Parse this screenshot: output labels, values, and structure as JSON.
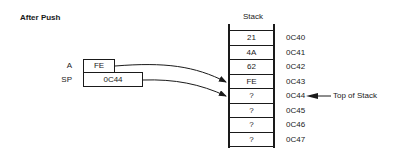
{
  "title": "After Push",
  "stack": {
    "title": "Stack",
    "rows": [
      {
        "value": "21",
        "address": "0C40"
      },
      {
        "value": "4A",
        "address": "0C41"
      },
      {
        "value": "62",
        "address": "0C42"
      },
      {
        "value": "FE",
        "address": "0C43"
      },
      {
        "value": "?",
        "address": "0C44"
      },
      {
        "value": "?",
        "address": "0C45"
      },
      {
        "value": "?",
        "address": "0C46"
      },
      {
        "value": "?",
        "address": "0C47"
      }
    ],
    "top_of_stack_label": "Top of Stack"
  },
  "registers": {
    "a": {
      "label": "A",
      "value": "FE"
    },
    "sp": {
      "label": "SP",
      "value": "0C44"
    }
  },
  "colors": {
    "line": "#1a1a1a",
    "background": "#ffffff"
  }
}
